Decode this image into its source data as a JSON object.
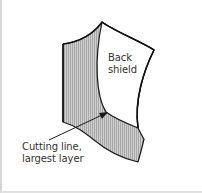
{
  "diagram": {
    "labels": {
      "back_shield": {
        "line1": "Back",
        "line2": "shield"
      },
      "cutting_line": {
        "line1": "Cutting line,",
        "line2": "largest layer"
      }
    },
    "colors": {
      "outline": "#1a1a1a",
      "hatch_fill": "#c4c4c4",
      "hatch_stripe": "#a9a9a9",
      "background": "#ffffff",
      "frame_border": "#d6d6d6"
    }
  }
}
